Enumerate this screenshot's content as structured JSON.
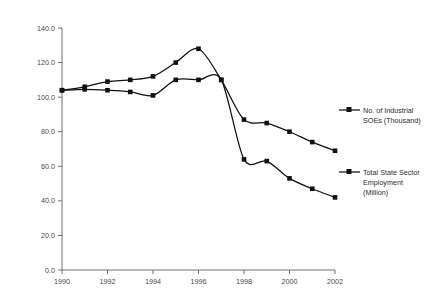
{
  "chart_data": {
    "type": "line",
    "title": "",
    "xlabel": "",
    "ylabel": "",
    "x": [
      1990,
      1991,
      1992,
      1993,
      1994,
      1995,
      1996,
      1997,
      1998,
      1999,
      2000,
      2001,
      2002
    ],
    "xlim": [
      1990,
      2002
    ],
    "ylim": [
      0.0,
      140.0
    ],
    "xticks": [
      1990,
      1992,
      1994,
      1996,
      1998,
      2000,
      2002
    ],
    "xtick_labels": [
      "1990",
      "1992",
      "1994",
      "1996",
      "1998",
      "2000",
      "2002"
    ],
    "yticks": [
      0.0,
      20.0,
      40.0,
      60.0,
      80.0,
      100.0,
      120.0,
      140.0
    ],
    "ytick_labels": [
      "0.0",
      "20.0",
      "40.0",
      "60.0",
      "80.0",
      "100.0",
      "120.0",
      "140.0"
    ],
    "grid": false,
    "legend_position": "right",
    "series": [
      {
        "name": "No. of Industrial SOEs (Thousand)",
        "marker": "square",
        "color": "#101010",
        "values": [
          104.0,
          104.5,
          104.0,
          103.0,
          101.0,
          110.0,
          110.0,
          110.0,
          64.0,
          63.0,
          53.0,
          47.0,
          42.0
        ]
      },
      {
        "name": "Total State Sector Employment (Million)",
        "marker": "square",
        "color": "#101010",
        "values": [
          104.0,
          106.0,
          109.0,
          110.0,
          112.0,
          120.0,
          128.0,
          110.0,
          87.0,
          85.0,
          80.0,
          74.0,
          69.0
        ]
      }
    ]
  },
  "legend": {
    "entries": [
      {
        "label_line1": "No. of Industrial",
        "label_line2": "SOEs (Thousand)",
        "label_line3": ""
      },
      {
        "label_line1": "Total State Sector",
        "label_line2": "Employment",
        "label_line3": "(Million)"
      }
    ]
  }
}
